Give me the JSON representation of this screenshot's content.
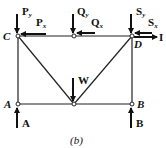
{
  "figure": {
    "caption": "(b)",
    "nodes": {
      "C": "C",
      "D": "D",
      "A": "A",
      "B": "B"
    },
    "forces": {
      "Py": {
        "base": "P",
        "sub": "y"
      },
      "Px": {
        "base": "P",
        "sub": "x"
      },
      "Qy": {
        "base": "Q",
        "sub": "y"
      },
      "Qx": {
        "base": "Q",
        "sub": "x"
      },
      "Sy": {
        "base": "S",
        "sub": "y"
      },
      "Sx": {
        "base": "S",
        "sub": "x"
      },
      "I": "I",
      "W": "W",
      "A": "A",
      "B": "B"
    }
  }
}
